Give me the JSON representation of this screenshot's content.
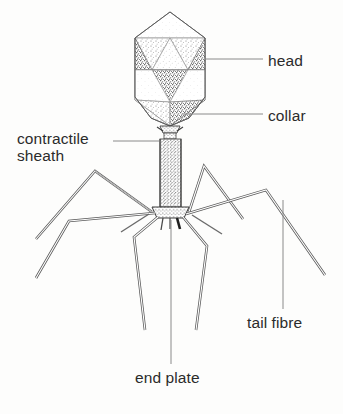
{
  "figure": {
    "style": "stippled pen-and-ink scientific illustration",
    "background_color": "#fdfdfc",
    "ink_color": "#2b2b2b",
    "leader_line_color": "#808080"
  },
  "labels": {
    "head": "head",
    "collar": "collar",
    "contractile": "contractile",
    "sheath": "sheath",
    "tail_fibre": "tail fibre",
    "end_plate": "end plate"
  },
  "parts": [
    {
      "name": "head",
      "label": "head",
      "leader": "horizontal-right"
    },
    {
      "name": "collar",
      "label": "collar",
      "leader": "horizontal-right"
    },
    {
      "name": "contractile-sheath",
      "label": "contractile sheath",
      "leader": "horizontal-left"
    },
    {
      "name": "tail-fibre",
      "label": "tail fibre",
      "leader": "vertical-up"
    },
    {
      "name": "end-plate",
      "label": "end plate",
      "leader": "vertical-up"
    }
  ]
}
